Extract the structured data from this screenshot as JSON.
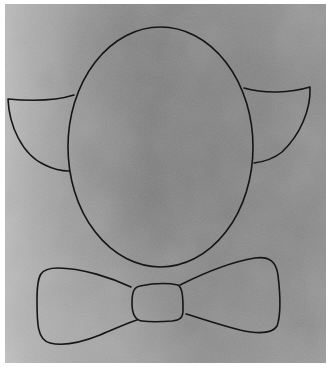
{
  "image": {
    "description": "Black line drawing on gray paper: oval face with two ears and a bow tie below",
    "colors": {
      "paper_dark": "#7c7c7c",
      "paper_mid": "#8e8e8e",
      "paper_light": "#b4b4b4",
      "border": "#ffffff",
      "ink": "#141414"
    },
    "shapes": [
      "head-oval",
      "left-ear",
      "right-ear",
      "bow-tie-left-wing",
      "bow-tie-knot",
      "bow-tie-right-wing"
    ]
  }
}
